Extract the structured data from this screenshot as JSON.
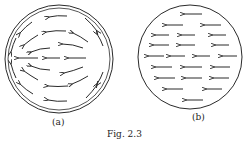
{
  "figure": {
    "caption": "Fig. 2.3",
    "panel_a": {
      "label": "(a)",
      "description": "circular field with curved arrows converging toward left pole",
      "circle": {
        "cx": 59,
        "cy": 59,
        "r": 54
      }
    },
    "panel_b": {
      "label": "(b)",
      "description": "uniform field of straight arrows pointing left",
      "circle": {
        "cx": 190,
        "cy": 57,
        "r": 52
      }
    },
    "ink_color": "#2a2a2a"
  }
}
